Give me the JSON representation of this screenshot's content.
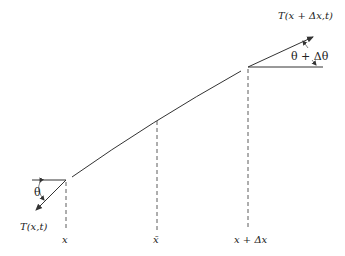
{
  "diagram": {
    "type": "string-element-tension",
    "labels": {
      "tension_right": "T(x + Δx,t)",
      "angle_right": "θ + Δθ",
      "angle_left": "θ",
      "tension_left": "T(x,t)",
      "x_left": "x",
      "x_mid": "x̄",
      "x_right": "x + Δx"
    },
    "colors": {
      "stroke": "#333333",
      "background": "#ffffff"
    }
  }
}
